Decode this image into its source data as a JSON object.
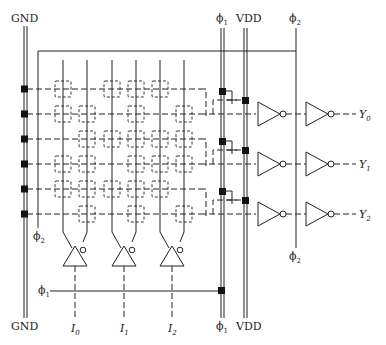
{
  "diagram": {
    "type": "dynamic PLA (precharged NOR-NOR) circuit schematic",
    "rails": {
      "gnd_top": "GND",
      "gnd_bottom": "GND",
      "phi1_top": "ϕ1",
      "phi1_bottom": "ϕ1",
      "vdd_top": "VDD",
      "vdd_bottom": "VDD",
      "phi2_top": "ϕ2",
      "phi2_bottom": "ϕ2",
      "phi2_left": "ϕ2",
      "phi1_clock_line": "ϕ1"
    },
    "inputs": [
      {
        "label": "I",
        "sub": "0"
      },
      {
        "label": "I",
        "sub": "1"
      },
      {
        "label": "I",
        "sub": "2"
      }
    ],
    "outputs": [
      {
        "label": "Y",
        "sub": "0"
      },
      {
        "label": "Y",
        "sub": "1"
      },
      {
        "label": "Y",
        "sub": "2"
      }
    ],
    "columns_x": [
      63,
      87,
      112,
      136,
      160,
      184
    ],
    "rows_y": [
      89,
      114,
      139,
      164,
      189,
      214
    ],
    "crosspoints": [
      [
        1,
        0,
        1,
        1,
        1,
        0
      ],
      [
        1,
        1,
        0,
        1,
        0,
        1
      ],
      [
        0,
        1,
        1,
        1,
        1,
        1
      ],
      [
        1,
        1,
        0,
        1,
        1,
        1
      ],
      [
        1,
        1,
        1,
        1,
        1,
        0
      ],
      [
        0,
        1,
        0,
        1,
        0,
        1
      ]
    ]
  }
}
